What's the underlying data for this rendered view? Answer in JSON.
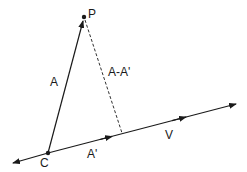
{
  "diagram": {
    "colors": {
      "stroke": "#1a1a1a",
      "background": "#ffffff"
    },
    "points": {
      "P": {
        "label": "P",
        "x": 84,
        "y": 17
      },
      "C": {
        "label": "C",
        "x": 48,
        "y": 153
      }
    },
    "vectors": {
      "A": {
        "label": "A"
      },
      "A_prime": {
        "label": "A'"
      },
      "A_minus_A_prime": {
        "label": "A-A'"
      },
      "V": {
        "label": "V"
      }
    }
  }
}
